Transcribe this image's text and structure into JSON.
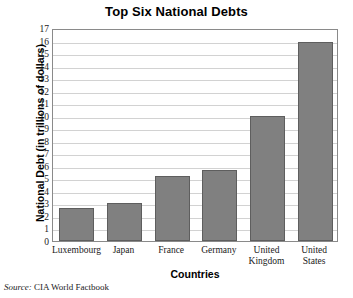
{
  "chart_data": {
    "type": "bar",
    "title": "Top Six National Debts",
    "xlabel": "Countries",
    "ylabel": "National Debt (in trillions of dollars)",
    "categories": [
      "Luxembourg",
      "Japan",
      "France",
      "Germany",
      "United Kingdom",
      "United States"
    ],
    "category_lines": [
      [
        "Luxembourg"
      ],
      [
        "Japan"
      ],
      [
        "France"
      ],
      [
        "Germany"
      ],
      [
        "United",
        "Kingdom"
      ],
      [
        "United",
        "States"
      ]
    ],
    "values": [
      2.6,
      3.0,
      5.2,
      5.7,
      10.0,
      15.9
    ],
    "ylim": [
      0,
      17
    ],
    "ytick_step": 1,
    "yticks": [
      "17",
      "16",
      "15",
      "14",
      "13",
      "12",
      "11",
      "10",
      "9",
      "8",
      "7",
      "6",
      "5",
      "4",
      "3",
      "2",
      "1",
      "0"
    ],
    "grid": true,
    "legend": false,
    "bar_color": "#808080",
    "bar_border_color": "#5e5e5e",
    "gridline_color": "#d2d2d2",
    "frame_color": "#8a8a8a"
  },
  "source": {
    "label": "Source:",
    "text": "CIA World Factbook"
  }
}
